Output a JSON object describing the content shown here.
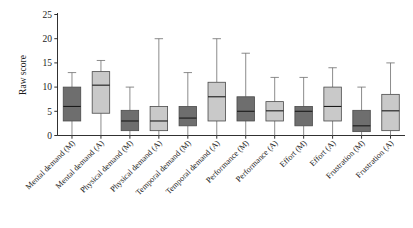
{
  "chart_data": {
    "type": "box",
    "title": "",
    "subtitle": "",
    "xlabel": "",
    "ylabel": "Raw score",
    "ylim": [
      0,
      25
    ],
    "yticks": [
      0,
      5,
      10,
      15,
      20,
      25
    ],
    "ytick_labels": [
      "0",
      "5",
      "10",
      "15",
      "20",
      "25"
    ],
    "grid": false,
    "legend": "none",
    "categories": [
      "Mental demand (M)",
      "Mental demand (A)",
      "Physical demand (M)",
      "Physical demand (A)",
      "Temporal demand (M)",
      "Temporal demand (A)",
      "Performance (M)",
      "Performance (A)",
      "Effort (M)",
      "Effort (A)",
      "Frustration (M)",
      "Frustration (A)"
    ],
    "colors": {
      "dark_box_fill": "#6e6e6e",
      "light_box_fill": "#c9c9c9",
      "box_edge": "#4a4a4a",
      "median": "#1a1a1a",
      "whisker": "#6e6e6e",
      "axis": "#1a1a1a",
      "background": "#ffffff"
    },
    "boxes": [
      {
        "category": "Mental demand (M)",
        "fill": "dark",
        "whisker_low": 0,
        "q1": 3.0,
        "median": 6.0,
        "q3": 10.0,
        "whisker_high": 13.0
      },
      {
        "category": "Mental demand (A)",
        "fill": "light",
        "whisker_low": 0,
        "q1": 4.6,
        "median": 10.4,
        "q3": 13.2,
        "whisker_high": 15.5
      },
      {
        "category": "Physical demand (M)",
        "fill": "dark",
        "whisker_low": 0,
        "q1": 1.0,
        "median": 3.0,
        "q3": 5.2,
        "whisker_high": 10.0
      },
      {
        "category": "Physical demand (A)",
        "fill": "light",
        "whisker_low": 0,
        "q1": 1.0,
        "median": 3.0,
        "q3": 6.0,
        "whisker_high": 20.0
      },
      {
        "category": "Temporal demand (M)",
        "fill": "dark",
        "whisker_low": 0,
        "q1": 2.0,
        "median": 3.6,
        "q3": 6.0,
        "whisker_high": 13.0
      },
      {
        "category": "Temporal demand (A)",
        "fill": "light",
        "whisker_low": 0,
        "q1": 3.0,
        "median": 8.0,
        "q3": 11.0,
        "whisker_high": 20.0
      },
      {
        "category": "Performance (M)",
        "fill": "dark",
        "whisker_low": 0,
        "q1": 3.0,
        "median": 5.0,
        "q3": 8.0,
        "whisker_high": 17.0
      },
      {
        "category": "Performance (A)",
        "fill": "light",
        "whisker_low": 0,
        "q1": 3.0,
        "median": 5.1,
        "q3": 7.0,
        "whisker_high": 12.0
      },
      {
        "category": "Effort (M)",
        "fill": "dark",
        "whisker_low": 0,
        "q1": 2.0,
        "median": 5.0,
        "q3": 6.0,
        "whisker_high": 12.0
      },
      {
        "category": "Effort (A)",
        "fill": "light",
        "whisker_low": 0,
        "q1": 3.0,
        "median": 6.0,
        "q3": 10.0,
        "whisker_high": 14.0
      },
      {
        "category": "Frustration (M)",
        "fill": "dark",
        "whisker_low": 0,
        "q1": 0.8,
        "median": 2.0,
        "q3": 5.2,
        "whisker_high": 10.0
      },
      {
        "category": "Frustration (A)",
        "fill": "light",
        "whisker_low": 0,
        "q1": 1.0,
        "median": 5.1,
        "q3": 8.5,
        "whisker_high": 15.0
      }
    ]
  }
}
